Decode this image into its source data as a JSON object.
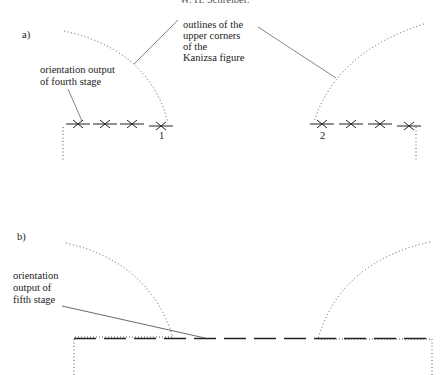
{
  "header": {
    "running_head": "W. H. Schreiber."
  },
  "panel_a": {
    "label": "a)",
    "annotation_outlines": [
      "outlines of the",
      "upper corners",
      "of the",
      "Kanizsa figure"
    ],
    "annotation_stage": [
      "orientation output",
      "of fourth stage"
    ],
    "marker_1": "1",
    "marker_2": "2"
  },
  "panel_b": {
    "label": "b)",
    "annotation_stage": [
      "orientation",
      "output of",
      "fifth stage"
    ]
  },
  "colors": {
    "ink": "#222222",
    "dotted": "#555555",
    "leader": "#444444"
  }
}
